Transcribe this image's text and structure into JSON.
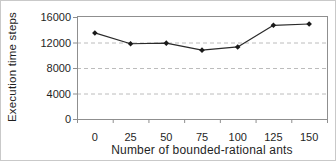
{
  "page": {
    "background": "#ffffff",
    "frame_border": "#c9c9c9"
  },
  "chart_data": {
    "type": "line",
    "title": "",
    "xlabel": "Number of bounded-rational ants",
    "ylabel": "Execution time steps",
    "x": [
      0,
      25,
      50,
      75,
      100,
      125,
      150
    ],
    "series": [
      {
        "name": "execution-time-steps",
        "values": [
          13500,
          11800,
          11900,
          10800,
          11300,
          14700,
          14900
        ]
      }
    ],
    "xticks": [
      "0",
      "25",
      "50",
      "75",
      "100",
      "125",
      "150"
    ],
    "yticks": [
      "0",
      "4000",
      "8000",
      "12000",
      "16000"
    ],
    "ylim": [
      0,
      16000
    ],
    "gridlines_at": [
      4000,
      8000,
      12000
    ],
    "grid_style": "dashed",
    "legend": "none",
    "marker": "diamond",
    "colors": {
      "line": "#2a2a2a",
      "marker": "#1a1a1a",
      "gridline": "#bcbcbc",
      "axis": "#8f8f8f",
      "text": "#1f1f1f",
      "background": "#ffffff"
    }
  }
}
